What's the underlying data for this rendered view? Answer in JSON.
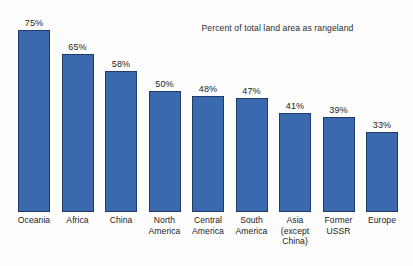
{
  "chart_data": {
    "type": "bar",
    "title": "Percent of total land area as rangeland",
    "xlabel": "",
    "ylabel": "",
    "ylim": [
      0,
      75
    ],
    "grid": false,
    "legend": "none",
    "unit": "%",
    "categories": [
      "Oceania",
      "Africa",
      "China",
      "North America",
      "Central America",
      "South America",
      "Asia (except China)",
      "Former USSR",
      "Europe"
    ],
    "values": [
      75,
      65,
      58,
      50,
      48,
      47,
      41,
      39,
      33
    ],
    "value_labels": [
      "75%",
      "65%",
      "58%",
      "50%",
      "48%",
      "47%",
      "41%",
      "39%",
      "33%"
    ],
    "category_label_lines": [
      [
        "Oceania"
      ],
      [
        "Africa"
      ],
      [
        "China"
      ],
      [
        "North",
        "America"
      ],
      [
        "Central",
        "America"
      ],
      [
        "South",
        "America"
      ],
      [
        "Asia",
        "(except",
        "China)"
      ],
      [
        "Former",
        "USSR"
      ],
      [
        "Europe"
      ]
    ],
    "colors": {
      "bar_fill": "#3a6aad",
      "bar_border": "#1f3a6b",
      "background": "#fdfdfd",
      "text": "#1c1c1c"
    }
  }
}
